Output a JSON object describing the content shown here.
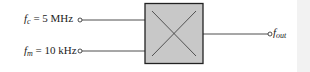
{
  "diagram": {
    "type": "mixer-block",
    "inputs": [
      {
        "symbol": "f",
        "subscript": "c",
        "value": "= 5 MHz"
      },
      {
        "symbol": "f",
        "subscript": "m",
        "value": "= 10 kHz"
      }
    ],
    "output": {
      "symbol": "f",
      "subscript": "out"
    },
    "block": {
      "fill": "#c8c8c8",
      "stroke": "#222222",
      "symbol": "multiplier-cross"
    }
  }
}
